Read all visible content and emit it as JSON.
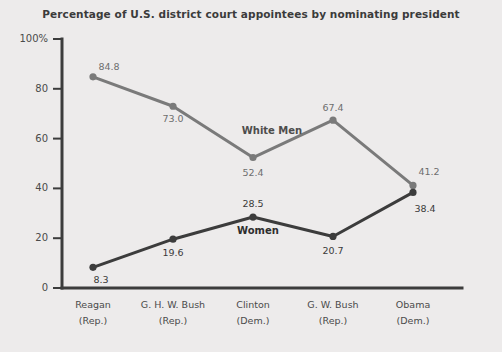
{
  "chart_data": {
    "type": "line",
    "title": "Percentage of U.S. district court appointees by nominating president",
    "xlabel": "",
    "ylabel": "",
    "ylim": [
      0,
      100
    ],
    "yticks": [
      0,
      20,
      40,
      60,
      80,
      100
    ],
    "ytick_labels": [
      "0",
      "20",
      "40",
      "60",
      "80",
      "100%"
    ],
    "grid": false,
    "legend_position": "inline-annotations",
    "categories": [
      "Reagan",
      "G. H. W. Bush",
      "Clinton",
      "G. W. Bush",
      "Obama"
    ],
    "category_sublabels": [
      "(Rep.)",
      "(Rep.)",
      "(Dem.)",
      "(Rep.)",
      "(Dem.)"
    ],
    "series": [
      {
        "name": "White Men",
        "color": "#7a7a7a",
        "values": [
          84.8,
          73.0,
          52.4,
          67.4,
          41.2
        ],
        "value_labels": [
          "84.8",
          "73.0",
          "52.4",
          "67.4",
          "41.2"
        ]
      },
      {
        "name": "Women",
        "color": "#3c3c3c",
        "values": [
          8.3,
          19.6,
          28.5,
          20.7,
          38.4
        ],
        "value_labels": [
          "8.3",
          "19.6",
          "28.5",
          "20.7",
          "38.4"
        ]
      }
    ],
    "annotations": [
      {
        "text": "White Men",
        "series": "White Men"
      },
      {
        "text": "Women",
        "series": "Women"
      }
    ]
  },
  "colors": {
    "background": "#edebeb",
    "axis": "#3c3c3c",
    "title": "#3b3b3b",
    "white_men": "#7a7a7a",
    "women": "#3c3c3c"
  }
}
